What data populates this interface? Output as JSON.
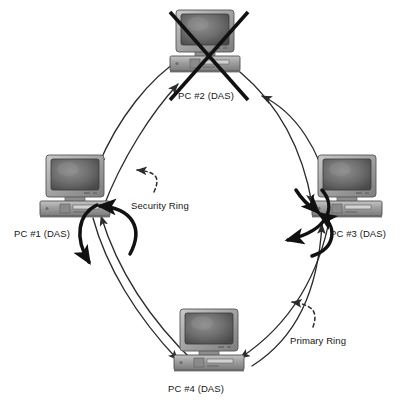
{
  "diagram": {
    "type": "network-topology",
    "background_color": "#ffffff",
    "line_color": "#2b2b2b",
    "wrap_arrow_color": "#111111",
    "failure_mark_color": "#111111",
    "chassis_color": "#9a9a9a",
    "screen_color": "#6e6e6e",
    "nodes": [
      {
        "id": "pc2",
        "label": "PC #2 (DAS)",
        "position": "top",
        "x": 168,
        "y": 8,
        "label_x": 178,
        "label_y": 90,
        "failed": true,
        "failure_marker": "x-cross"
      },
      {
        "id": "pc1",
        "label": "PC #1 (DAS)",
        "position": "left",
        "x": 38,
        "y": 153,
        "label_x": 14,
        "label_y": 228,
        "failed": false,
        "wrap": true
      },
      {
        "id": "pc3",
        "label": "PC #3 (DAS)",
        "position": "right",
        "x": 310,
        "y": 153,
        "label_x": 330,
        "label_y": 228,
        "failed": false,
        "wrap": true
      },
      {
        "id": "pc4",
        "label": "PC #4 (DAS)",
        "position": "bottom",
        "x": 172,
        "y": 307,
        "label_x": 168,
        "label_y": 383,
        "failed": false,
        "wrap": false
      }
    ],
    "ring_annotations": [
      {
        "id": "security-ring",
        "label": "Security Ring",
        "label_x": 131,
        "label_y": 200,
        "pointer": "dashed-curved-arrow",
        "pointer_direction": "up-left"
      },
      {
        "id": "primary-ring",
        "label": "Primary Ring",
        "label_x": 290,
        "label_y": 335,
        "pointer": "dashed-curved-arrow",
        "pointer_direction": "up-left"
      }
    ],
    "links": [
      {
        "from": "pc2",
        "to": "pc1",
        "style": "solid-curved-arrow"
      },
      {
        "from": "pc1",
        "to": "pc2",
        "style": "solid-curved-arrow"
      },
      {
        "from": "pc3",
        "to": "pc2",
        "style": "solid-curved-arrow"
      },
      {
        "from": "pc2",
        "to": "pc3",
        "style": "solid-curved-arrow"
      },
      {
        "from": "pc1",
        "to": "pc4",
        "style": "solid-curved-arrow"
      },
      {
        "from": "pc4",
        "to": "pc1",
        "style": "solid-curved-arrow"
      },
      {
        "from": "pc3",
        "to": "pc4",
        "style": "solid-curved-arrow"
      },
      {
        "from": "pc4",
        "to": "pc3",
        "style": "solid-curved-arrow"
      }
    ]
  }
}
